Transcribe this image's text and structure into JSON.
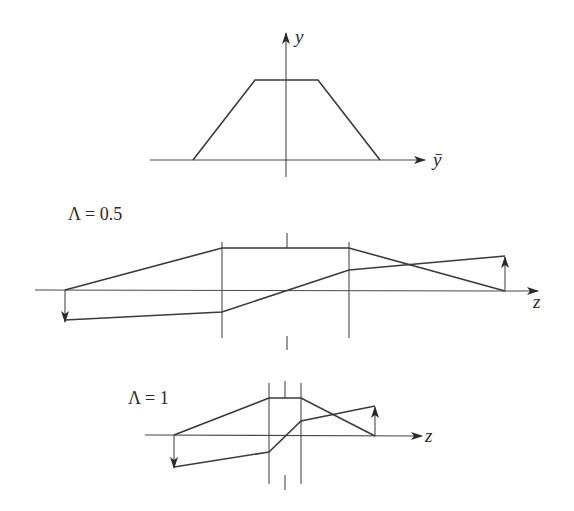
{
  "top_panel": {
    "y_axis_label": "y",
    "x_axis_label": "ȳ",
    "shape": "trapezoid"
  },
  "middle_panel": {
    "label": "Λ = 0.5",
    "axis_label": "z"
  },
  "bottom_panel": {
    "label": "Λ = 1",
    "axis_label": "z"
  },
  "colors": {
    "stroke": "#3a3a3a",
    "background": "#ffffff"
  }
}
